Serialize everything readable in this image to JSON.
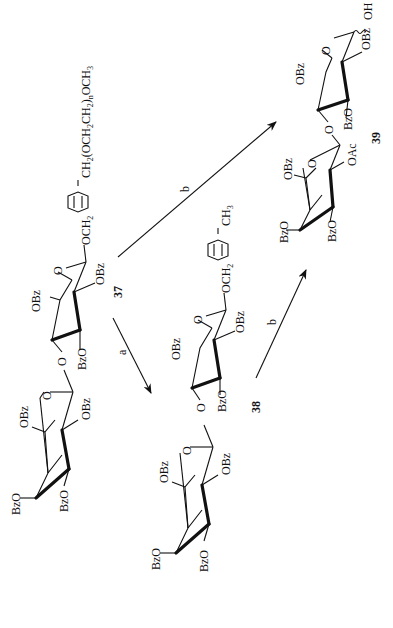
{
  "scheme": {
    "orientation": "rotated 90 degrees counter-clockwise (text reads bottom-to-top)",
    "compounds": [
      {
        "id": "37",
        "label": "37",
        "substituents": {
          "ring1": [
            "BzO",
            "BzO",
            "OBz",
            "OBz"
          ],
          "ring2": [
            "OBz",
            "BzO",
            "OBz"
          ],
          "linker_left": "OCH",
          "linker_left_sub": "2",
          "aglycon": "CH2(OCH2CH2)nOCH3",
          "aglycon_parts": [
            "CH",
            "2",
            "(OCH",
            "2",
            "CH",
            "2",
            ")",
            "n",
            "OCH",
            "3"
          ]
        }
      },
      {
        "id": "38",
        "label": "38",
        "substituents": {
          "ring1": [
            "BzO",
            "BzO",
            "OBz",
            "OBz"
          ],
          "ring2": [
            "OBz",
            "BzO",
            "OBz"
          ],
          "linker_left": "OCH",
          "linker_left_sub": "2",
          "aglycon": "CH3",
          "aglycon_parts": [
            "CH",
            "3"
          ]
        }
      },
      {
        "id": "39",
        "label": "39",
        "substituents": {
          "ring1": [
            "BzO",
            "BzO",
            "OBz",
            "OAc"
          ],
          "ring2": [
            "OBz",
            "BzO",
            "OBz"
          ],
          "anomeric": "OH"
        }
      }
    ],
    "ring_oxygen": "O",
    "glycosidic_oxygen": "O",
    "reactions": [
      {
        "from": "37",
        "to": "38",
        "reagent_label": "a"
      },
      {
        "from": "37",
        "to": "39",
        "reagent_label": "b"
      },
      {
        "from": "38",
        "to": "39",
        "reagent_label": "b"
      }
    ]
  }
}
